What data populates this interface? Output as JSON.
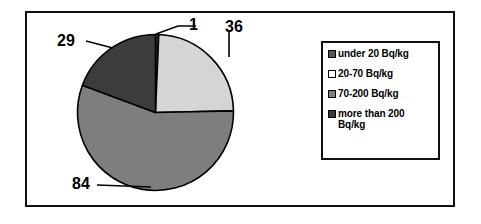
{
  "chart_data": {
    "type": "pie",
    "title": "",
    "subtitle": "",
    "xlabel": "",
    "ylabel": "",
    "grid": false,
    "legend_position": "right",
    "categories": [
      "under 20 Bq/kg",
      "20-70 Bq/kg",
      "70-200 Bq/kg",
      "more than  200 Bq/kg"
    ],
    "values": [
      1,
      36,
      84,
      29
    ],
    "total": 150,
    "slices": [
      {
        "label": "under 20 Bq/kg",
        "value": 1,
        "value_text": "1",
        "color": "#3C3C3C",
        "start_angle_deg": 0.0,
        "sweep_angle_deg": 2.4
      },
      {
        "label": "20-70 Bq/kg",
        "value": 36,
        "value_text": "36",
        "color": "#D5D5D5",
        "start_angle_deg": 2.4,
        "sweep_angle_deg": 86.4
      },
      {
        "label": "70-200 Bq/kg",
        "value": 84,
        "value_text": "84",
        "color": "#7E7E7E",
        "start_angle_deg": 88.8,
        "sweep_angle_deg": 201.6
      },
      {
        "label": "more than  200 Bq/kg",
        "value": 29,
        "value_text": "29",
        "color": "#3C3C3C",
        "start_angle_deg": 290.4,
        "sweep_angle_deg": 69.6
      }
    ]
  },
  "legend": {
    "items": [
      {
        "label": "under 20 Bq/kg",
        "color": "#565656"
      },
      {
        "label": "20-70 Bq/kg",
        "color": "#FFFFFF"
      },
      {
        "label": "70-200 Bq/kg",
        "color": "#808080"
      },
      {
        "label": "more than  200 Bq/kg",
        "color": "#3C3C3C"
      }
    ]
  },
  "colors": {
    "outline": "#111111",
    "text": "#000000",
    "background": "#FFFFFF",
    "light_gray": "#D5D5D5",
    "medium_gray": "#7E7E7E",
    "dark_gray": "#3C3C3C"
  }
}
